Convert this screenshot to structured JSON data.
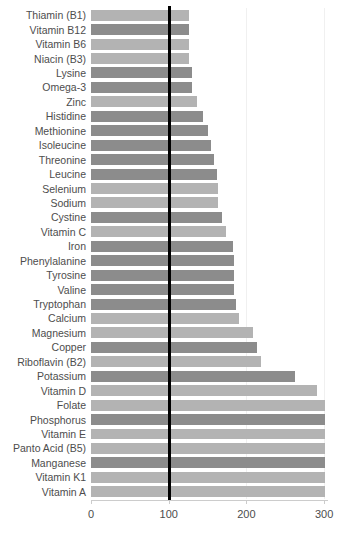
{
  "chart_data": {
    "type": "bar",
    "orientation": "horizontal",
    "title": "",
    "xlabel": "",
    "ylabel": "",
    "xlim": [
      0,
      305
    ],
    "xticks": [
      0,
      100,
      200,
      300
    ],
    "xtick_labels": [
      "0",
      "100",
      "200",
      "300"
    ],
    "grid": true,
    "grid_axis": "x",
    "legend": "none",
    "reference_line": {
      "value": 100,
      "color": "#000000",
      "width_px": 3
    },
    "colors": {
      "light": "#b3b3b3",
      "dark": "#8c8c8c",
      "reference": "#000000",
      "text": "#4d4d4d",
      "grid": "#f0f0f0"
    },
    "categories": [
      "Thiamin (B1)",
      "Vitamin B12",
      "Vitamin B6",
      "Niacin (B3)",
      "Lysine",
      "Omega-3",
      "Zinc",
      "Histidine",
      "Methionine",
      "Isoleucine",
      "Threonine",
      "Leucine",
      "Selenium",
      "Sodium",
      "Cystine",
      "Vitamin C",
      "Iron",
      "Phenylalanine",
      "Tyrosine",
      "Valine",
      "Tryptophan",
      "Calcium",
      "Magnesium",
      "Copper",
      "Riboflavin (B2)",
      "Potassium",
      "Vitamin D",
      "Folate",
      "Phosphorus",
      "Vitamin E",
      "Panto Acid (B5)",
      "Manganese",
      "Vitamin K1",
      "Vitamin A"
    ],
    "values": [
      126,
      126,
      126,
      126,
      130,
      130,
      136,
      144,
      150,
      154,
      158,
      162,
      164,
      164,
      169,
      174,
      183,
      184,
      184,
      184,
      186,
      191,
      209,
      214,
      219,
      263,
      291,
      301,
      301,
      301,
      301,
      301,
      301,
      301
    ],
    "bar_shades": [
      "light",
      "dark",
      "light",
      "light",
      "dark",
      "dark",
      "light",
      "dark",
      "dark",
      "dark",
      "dark",
      "dark",
      "light",
      "light",
      "dark",
      "light",
      "dark",
      "dark",
      "dark",
      "dark",
      "dark",
      "light",
      "light",
      "dark",
      "light",
      "dark",
      "light",
      "light",
      "dark",
      "light",
      "light",
      "dark",
      "light",
      "light"
    ]
  }
}
